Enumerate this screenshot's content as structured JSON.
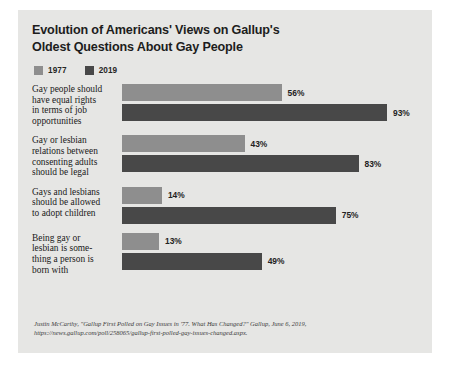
{
  "chart_data": {
    "type": "bar",
    "title": "Evolution of Americans' Views on Gallup's Oldest Questions About Gay People",
    "title_lines": [
      "Evolution of Americans' Views on Gallup's",
      "Oldest Questions About Gay People"
    ],
    "xlabel": "",
    "ylabel": "",
    "xlim": [
      0,
      100
    ],
    "grid": false,
    "legend_position": "top-left",
    "orientation": "horizontal",
    "value_suffix": "%",
    "categories": [
      "Gay people should have equal rights in terms of job opportunities",
      "Gay or lesbian relations between consenting adults should be legal",
      "Gays and lesbians should be allowed to adopt children",
      "Being gay or lesbian is something a person is born with"
    ],
    "category_lines": [
      [
        "Gay people should",
        "have equal rights",
        "in terms of job",
        "opportunities"
      ],
      [
        "Gay or lesbian",
        "relations between",
        "consenting adults",
        "should be legal"
      ],
      [
        "Gays and lesbians",
        "should be allowed",
        "to adopt children"
      ],
      [
        "Being gay or",
        "lesbian is some-",
        "thing a person is",
        "born with"
      ]
    ],
    "series": [
      {
        "name": "1977",
        "color": "#8e8e8e",
        "values": [
          56,
          43,
          14,
          13
        ],
        "value_labels": [
          "56%",
          "43%",
          "14%",
          "13%"
        ]
      },
      {
        "name": "2019",
        "color": "#484848",
        "values": [
          93,
          83,
          75,
          49
        ],
        "value_labels": [
          "93%",
          "83%",
          "75%",
          "49%"
        ]
      }
    ]
  },
  "legend": {
    "items": [
      {
        "label": "1977",
        "color": "#8e8e8e"
      },
      {
        "label": "2019",
        "color": "#484848"
      }
    ]
  },
  "source": {
    "lines": [
      "Justin McCarthy, \"Gallup First Polled on Gay Issues in '77. What Has Changed?\" Gallup, June 6, 2019,",
      "https://news.gallup.com/poll/258065/gallup-first-polled-gay-issues-changed.aspx."
    ]
  },
  "colors": {
    "card_background": "#e6e6e4",
    "page_background": "#ffffff",
    "bar_1977": "#8e8e8e",
    "bar_2019": "#484848",
    "text": "#1a1a1a"
  }
}
